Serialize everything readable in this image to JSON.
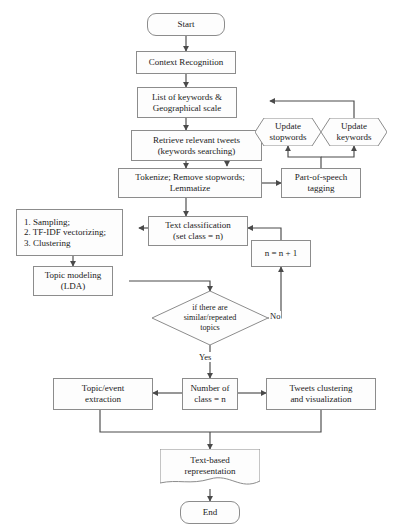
{
  "diagram": {
    "type": "flowchart",
    "canvas": {
      "width": 400,
      "height": 527
    },
    "colors": {
      "stroke": "#8c8c8c",
      "arrow": "#4a4a4a",
      "text": "#1a1a1a",
      "background": "#ffffff",
      "node_fill": "#fdfdfd"
    }
  },
  "nodes": {
    "start": {
      "label": "Start",
      "shape": "terminator"
    },
    "context_recognition": {
      "label": "Context Recognition",
      "shape": "rectangle"
    },
    "keywords_list": {
      "label": "List of keywords &\nGeographical scale",
      "shape": "rectangle"
    },
    "retrieve_tweets": {
      "label": "Retrieve relevant tweets\n(keywords searching)",
      "shape": "rectangle"
    },
    "update_stopwords": {
      "label": "Update\nstopwords",
      "shape": "hexagon"
    },
    "update_keywords": {
      "label": "Update\nkeywords",
      "shape": "hexagon"
    },
    "tokenize": {
      "label": "Tokenize; Remove stopwords;\nLemmatize",
      "shape": "rectangle"
    },
    "pos_tagging": {
      "label": "Part-of-speech\ntagging",
      "shape": "rectangle"
    },
    "text_classification": {
      "label": "Text classification\n(set class = n)",
      "shape": "rectangle"
    },
    "methods_list": {
      "label": "1. Sampling;\n2. TF-IDF vectorizing;\n3. Clustering",
      "shape": "rectangle"
    },
    "increment": {
      "label": "n = n + 1",
      "shape": "rectangle"
    },
    "topic_modeling": {
      "label": "Topic modeling\n(LDA)",
      "shape": "rectangle"
    },
    "decision": {
      "label": "if there are\nsimilar/repeated\ntopics",
      "shape": "diamond"
    },
    "topic_extraction": {
      "label": "Topic/event\nextraction",
      "shape": "rectangle"
    },
    "number_of_class": {
      "label": "Number of\nclass = n",
      "shape": "rectangle"
    },
    "tweets_clustering": {
      "label": "Tweets clustering\nand visualization",
      "shape": "rectangle"
    },
    "text_representation": {
      "label": "Text-based\nrepresentation",
      "shape": "document"
    },
    "end": {
      "label": "End",
      "shape": "terminator"
    }
  },
  "edge_labels": {
    "no": "No",
    "yes": "Yes"
  }
}
